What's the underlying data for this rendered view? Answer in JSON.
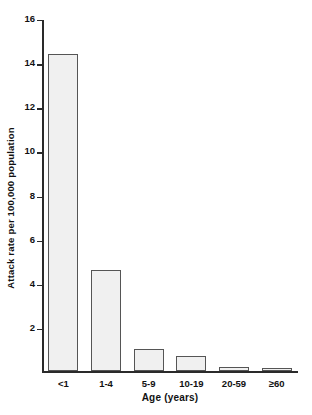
{
  "chart_data": {
    "type": "bar",
    "title": "",
    "subtitle": "",
    "categories": [
      "<1",
      "1-4",
      "5-9",
      "10-19",
      "20-59",
      "≥60"
    ],
    "values": [
      14.4,
      4.6,
      1.0,
      0.7,
      0.2,
      0.15
    ],
    "xlabel": "Age (years)",
    "ylabel": "Attack rate per 100,000 population",
    "ylim": [
      0,
      16
    ],
    "ytick_labels": [
      "16",
      "14",
      "12",
      "10",
      "8",
      "6",
      "4",
      "2"
    ],
    "ytick_values": [
      16,
      14,
      12,
      10,
      8,
      6,
      4,
      2
    ],
    "ytick_interval": 2,
    "grid": false,
    "legend": null,
    "annotations": [],
    "bar_fill_color": "#f0f0f0",
    "bar_edge_color": "#555555",
    "axis_color": "#2a2a2a",
    "background_color": "#ffffff"
  }
}
